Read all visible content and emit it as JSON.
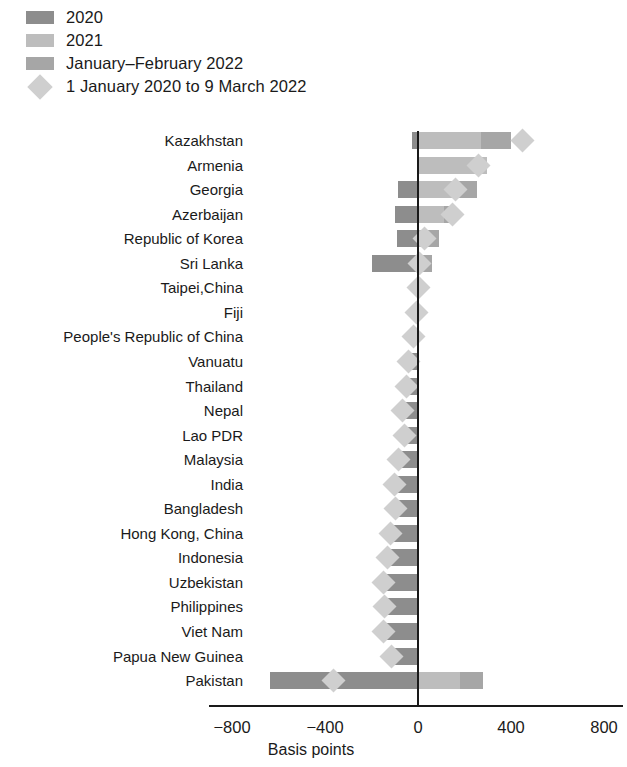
{
  "legend": {
    "items": [
      {
        "label": "2020",
        "type": "swatch",
        "color": "#8d8d8d"
      },
      {
        "label": "2021",
        "type": "swatch",
        "color": "#bdbdbd"
      },
      {
        "label": "January–February 2022",
        "type": "swatch",
        "color": "#a6a6a6"
      },
      {
        "label": "1 January 2020 to 9 March 2022",
        "type": "diamond",
        "color": "#cfcfcf"
      }
    ]
  },
  "axis": {
    "title": "Basis points",
    "ticks": [
      -800,
      -400,
      0,
      400,
      800
    ],
    "tick_labels": [
      "−800",
      "−400",
      "0",
      "400",
      "800"
    ],
    "xlim": [
      -900,
      880
    ]
  },
  "chart_data": {
    "type": "bar",
    "orientation": "horizontal",
    "title": "",
    "xlabel": "Basis points",
    "ylabel": "",
    "xlim": [
      -900,
      880
    ],
    "grid": false,
    "legend_position": "top-left",
    "stacked": true,
    "categories": [
      "Kazakhstan",
      "Armenia",
      "Georgia",
      "Azerbaijan",
      "Republic of Korea",
      "Sri Lanka",
      "Taipei,China",
      "Fiji",
      "People's Republic of China",
      "Vanuatu",
      "Thailand",
      "Nepal",
      "Lao PDR",
      "Malaysia",
      "India",
      "Bangladesh",
      "Hong Kong, China",
      "Indonesia",
      "Uzbekistan",
      "Philippines",
      "Viet Nam",
      "Papua New Guinea",
      "Pakistan"
    ],
    "series": [
      {
        "name": "2020",
        "color": "#8d8d8d",
        "values": [
          -25,
          0,
          -85,
          -100,
          -90,
          -200,
          -15,
          -5,
          -20,
          -40,
          -50,
          -65,
          -60,
          -85,
          -100,
          -95,
          -120,
          -130,
          -150,
          -145,
          -150,
          -115,
          -635
        ]
      },
      {
        "name": "2021",
        "color": "#bdbdbd",
        "values": [
          270,
          295,
          170,
          110,
          40,
          0,
          0,
          0,
          0,
          0,
          0,
          0,
          0,
          0,
          0,
          0,
          0,
          0,
          0,
          0,
          0,
          0,
          180
        ]
      },
      {
        "name": "January–February 2022",
        "color": "#a6a6a6",
        "values": [
          130,
          0,
          85,
          55,
          50,
          60,
          10,
          5,
          0,
          0,
          0,
          0,
          0,
          0,
          0,
          0,
          0,
          0,
          0,
          0,
          0,
          0,
          100
        ]
      }
    ],
    "markers": {
      "name": "1 January 2020 to 9 March 2022",
      "color": "#cfcfcf",
      "values": [
        450,
        260,
        160,
        150,
        30,
        5,
        0,
        -5,
        -20,
        -40,
        -50,
        -65,
        -60,
        -85,
        -100,
        -95,
        -120,
        -130,
        -150,
        -145,
        -150,
        -115,
        -365
      ]
    }
  }
}
